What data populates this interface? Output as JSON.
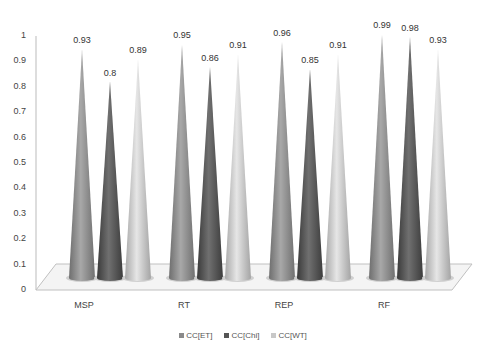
{
  "chart_data": {
    "type": "bar",
    "subtype": "3d-cone",
    "title": "",
    "xlabel": "",
    "ylabel": "",
    "categories": [
      "MSP",
      "RT",
      "REP",
      "RF"
    ],
    "series": [
      {
        "name": "CC[ET]",
        "values": [
          0.93,
          0.95,
          0.96,
          0.99
        ],
        "color": "#8a8a8a"
      },
      {
        "name": "CC[Chi]",
        "values": [
          0.8,
          0.86,
          0.85,
          0.98
        ],
        "color": "#555555"
      },
      {
        "name": "CC[WT]",
        "values": [
          0.89,
          0.91,
          0.91,
          0.93
        ],
        "color": "#c8c8c8"
      }
    ],
    "ylim": [
      0,
      1
    ],
    "yticks": [
      "0",
      "0.1",
      "0.2",
      "0.3",
      "0.4",
      "0.5",
      "0.6",
      "0.7",
      "0.8",
      "0.9",
      "1"
    ],
    "grid": false,
    "legend_position": "bottom",
    "data_labels": true
  },
  "legend": {
    "items": [
      {
        "label": "CC[ET]",
        "color": "#8a8a8a"
      },
      {
        "label": "CC[Chi]",
        "color": "#555555"
      },
      {
        "label": "CC[WT]",
        "color": "#c8c8c8"
      }
    ]
  }
}
